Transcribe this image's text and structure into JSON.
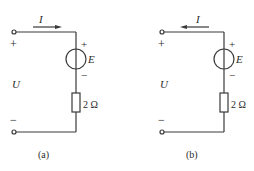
{
  "figure": {
    "circuits": [
      {
        "id": "a",
        "caption": "(a)",
        "current_label": "I",
        "current_direction": "right",
        "voltage_label": "U",
        "terminal_plus": "+",
        "terminal_minus": "−",
        "source_label": "E",
        "source_plus": "+",
        "source_minus": "−",
        "resistor_label": "2 Ω"
      },
      {
        "id": "b",
        "caption": "(b)",
        "current_label": "I",
        "current_direction": "left",
        "voltage_label": "U",
        "terminal_plus": "+",
        "terminal_minus": "−",
        "source_label": "E",
        "source_plus": "+",
        "source_minus": "−",
        "resistor_label": "2 Ω"
      }
    ],
    "colors": {
      "line": "#3a3a3a",
      "background": "#ffffff"
    }
  }
}
